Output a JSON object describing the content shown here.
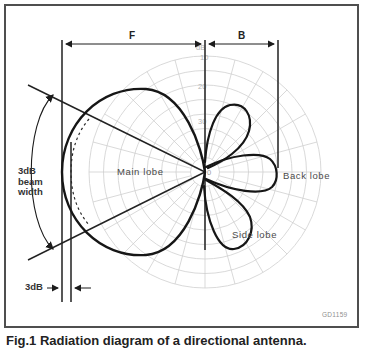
{
  "diagram": {
    "type": "antenna-radiation-pattern-polar-diagram",
    "code": "GD1159",
    "caption": "Fig.1 Radiation diagram of a directional antenna.",
    "regions": {
      "front": "F",
      "back": "B"
    },
    "lobes": {
      "main": "Main lobe",
      "back": "Back lobe",
      "side": "Side lobe"
    },
    "beamwidth": {
      "line1": "3dB",
      "line2": "beam",
      "line3": "width"
    },
    "offset_label": "3dB",
    "scale": {
      "unit": "dB",
      "ticks": [
        "10",
        "20",
        "30"
      ],
      "origin": "0"
    }
  },
  "colors": {
    "frame": "#4f4f4f",
    "grid": "#cfcfcf",
    "pattern_curve": "#161616",
    "construction_lines": "#2e2e2e",
    "tick_text": "#b4b4b4",
    "label_text": "#3a3a3a"
  }
}
